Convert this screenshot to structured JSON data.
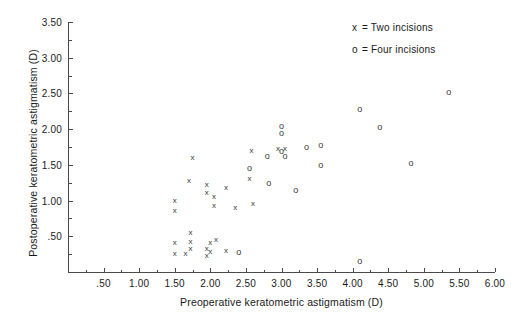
{
  "chart_data": {
    "type": "scatter",
    "title": "",
    "xlabel": "Preoperative keratometric astigmatism (D)",
    "ylabel": "Postoperative keratometric astigmatism (D)",
    "xlim": [
      0.0,
      6.0
    ],
    "ylim": [
      0.0,
      3.5
    ],
    "xticks": [
      0.5,
      1.0,
      1.5,
      2.0,
      2.5,
      3.0,
      3.5,
      4.0,
      4.5,
      5.0,
      5.5,
      6.0
    ],
    "xticklabels": [
      ".50",
      "1.00",
      "1.50",
      "2.00",
      "2.50",
      "3.00",
      "3.50",
      "4.00",
      "4.50",
      "5.00",
      "5.50",
      "6.00"
    ],
    "yticks": [
      0.5,
      1.0,
      1.5,
      2.0,
      2.5,
      3.0,
      3.5
    ],
    "yticklabels": [
      ".50",
      "1.00",
      "1.50",
      "2.00",
      "2.50",
      "3.00",
      "3.50"
    ],
    "x_minor_tick_interval": 0.25,
    "y_minor_tick_interval": 0.25,
    "grid": false,
    "legend_position": "top-right",
    "series": [
      {
        "name": "Two incisions",
        "symbol": "x",
        "legend_label": "x = Two incisions",
        "points": [
          [
            1.5,
            0.4
          ],
          [
            1.5,
            0.25
          ],
          [
            1.5,
            1.0
          ],
          [
            1.5,
            0.85
          ],
          [
            1.65,
            0.25
          ],
          [
            1.7,
            1.28
          ],
          [
            1.72,
            0.55
          ],
          [
            1.72,
            0.42
          ],
          [
            1.72,
            0.32
          ],
          [
            1.75,
            1.6
          ],
          [
            1.95,
            1.22
          ],
          [
            1.95,
            1.1
          ],
          [
            1.95,
            0.32
          ],
          [
            1.95,
            0.22
          ],
          [
            2.0,
            0.4
          ],
          [
            2.0,
            0.28
          ],
          [
            2.05,
            1.05
          ],
          [
            2.05,
            0.92
          ],
          [
            2.08,
            0.45
          ],
          [
            2.22,
            1.18
          ],
          [
            2.22,
            0.3
          ],
          [
            2.35,
            0.9
          ],
          [
            2.55,
            1.3
          ],
          [
            2.58,
            1.7
          ],
          [
            2.6,
            0.95
          ],
          [
            2.95,
            1.72
          ],
          [
            3.05,
            1.72
          ]
        ]
      },
      {
        "name": "Four incisions",
        "symbol": "o",
        "legend_label": "o = Four incisions",
        "points": [
          [
            2.55,
            1.45
          ],
          [
            2.8,
            1.62
          ],
          [
            2.82,
            1.25
          ],
          [
            3.0,
            2.05
          ],
          [
            3.0,
            1.95
          ],
          [
            3.0,
            1.7
          ],
          [
            3.05,
            1.62
          ],
          [
            3.2,
            1.15
          ],
          [
            3.35,
            1.75
          ],
          [
            3.55,
            1.78
          ],
          [
            3.55,
            1.5
          ],
          [
            4.1,
            2.28
          ],
          [
            4.1,
            0.15
          ],
          [
            4.38,
            2.03
          ],
          [
            4.82,
            1.52
          ],
          [
            5.35,
            2.52
          ],
          [
            2.4,
            0.28
          ]
        ]
      }
    ]
  },
  "legend": {
    "rows": [
      {
        "symbol": "x",
        "text": "= Two incisions"
      },
      {
        "symbol": "o",
        "text": "= Four incisions"
      }
    ]
  },
  "axes": {
    "x_title": "Preoperative keratometric astigmatism (D)",
    "y_title": "Postoperative keratometric astigmatism (D)"
  }
}
